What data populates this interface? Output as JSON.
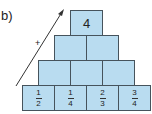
{
  "label": "b)",
  "arrow": {
    "sign": "+"
  },
  "pyramid": {
    "top": "4",
    "row2": [
      "",
      ""
    ],
    "row3": [
      "",
      "",
      ""
    ],
    "bottom": [
      {
        "num": "1",
        "den": "2"
      },
      {
        "num": "1",
        "den": "4"
      },
      {
        "num": "2",
        "den": "3"
      },
      {
        "num": "3",
        "den": "4"
      }
    ]
  }
}
